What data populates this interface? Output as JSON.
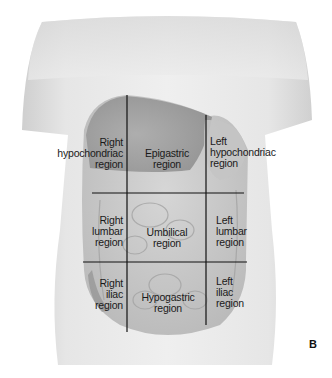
{
  "diagram": {
    "panel_label": "B",
    "colors": {
      "skin": "#e4e4e4",
      "skin_shadow": "#c9c9c9",
      "organ": "#b5b5b5",
      "organ_dark": "#8f8f8f",
      "line": "#111111"
    },
    "regions": [
      {
        "id": "right-hypochondriac",
        "lines": [
          "Right",
          "hypochondriac",
          "region"
        ]
      },
      {
        "id": "epigastric",
        "lines": [
          "Epigastric",
          "region"
        ]
      },
      {
        "id": "left-hypochondriac",
        "lines": [
          "Left",
          "hypochondriac",
          "region"
        ]
      },
      {
        "id": "right-lumbar",
        "lines": [
          "Right",
          "lumbar",
          "region"
        ]
      },
      {
        "id": "umbilical",
        "lines": [
          "Umbilical",
          "region"
        ]
      },
      {
        "id": "left-lumbar",
        "lines": [
          "Left",
          "lumbar",
          "region"
        ]
      },
      {
        "id": "right-iliac",
        "lines": [
          "Right",
          "iliac",
          "region"
        ]
      },
      {
        "id": "hypogastric",
        "lines": [
          "Hypogastric",
          "region"
        ]
      },
      {
        "id": "left-iliac",
        "lines": [
          "Left",
          "iliac",
          "region"
        ]
      }
    ]
  }
}
